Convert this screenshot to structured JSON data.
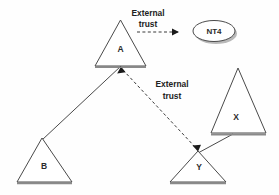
{
  "diagram": {
    "background_color": "#fefefe",
    "line_color": "#4a4a4a",
    "shadow_color": "#8a8a8a",
    "text_color": "#222222",
    "nodes": [
      {
        "id": "A",
        "label": "A",
        "shape": "triangle",
        "cx": 120,
        "cy": 60
      },
      {
        "id": "B",
        "label": "B",
        "shape": "triangle",
        "cx": 47,
        "cy": 182
      },
      {
        "id": "X",
        "label": "X",
        "shape": "triangle",
        "cx": 237,
        "cy": 113
      },
      {
        "id": "Y",
        "label": "Y",
        "shape": "triangle",
        "cx": 197,
        "cy": 182
      },
      {
        "id": "NT4",
        "label": "NT4",
        "shape": "oval",
        "cx": 214,
        "cy": 31
      }
    ],
    "labels": {
      "external_trust_top_line1": "External",
      "external_trust_top_line2": "trust",
      "external_trust_mid_line1": "External",
      "external_trust_mid_line2": "trust"
    },
    "connections": [
      {
        "from": "B",
        "to": "A",
        "style": "solid",
        "arrow": "none"
      },
      {
        "from": "X",
        "to": "Y",
        "style": "solid",
        "arrow": "none"
      },
      {
        "from": "A",
        "to": "NT4",
        "style": "dashed",
        "arrow": "to",
        "caption": "External trust"
      },
      {
        "from": "A",
        "to": "Y",
        "style": "dashed",
        "arrow": "both",
        "caption": "External trust"
      }
    ]
  }
}
